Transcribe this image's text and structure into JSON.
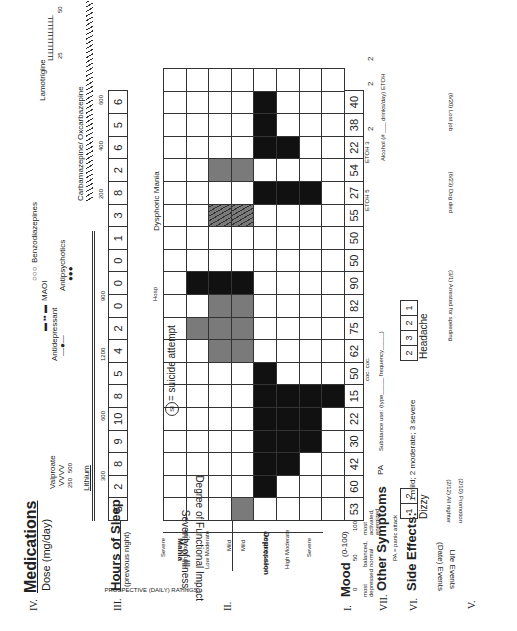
{
  "sections": {
    "medications": {
      "numeral": "IV.",
      "title": "Medications",
      "subtitle": "Dose (mg/day)"
    },
    "sleep": {
      "numeral": "III.",
      "title": "Hours of Sleep",
      "subtitle": "(previous night)"
    },
    "severity": {
      "numeral": "II.",
      "title_line1": "Severity of Illness:",
      "title_line2": "Degree of Functional Impact"
    },
    "mood": {
      "numeral": "I.",
      "title": "Mood",
      "range": "(0-100)",
      "low_value": "0",
      "mid_value": "50",
      "high_value": "100",
      "low_label": "most depressed",
      "mid_label": "balanced, normal",
      "high_label": "most activated, energized"
    },
    "other_symptoms": {
      "numeral": "VII.",
      "title": "Other Symptoms",
      "legend": "PA = panic attack"
    },
    "side_effects": {
      "numeral": "VI.",
      "title": "Side Effects:",
      "scale": "1 mild; 2 moderate; 3 severe"
    },
    "life_events": {
      "numeral": "V.",
      "title": "Life Events",
      "subtitle": "(Date) Events"
    }
  },
  "medications": {
    "valproate": {
      "name": "Valproate",
      "marker": "VVVV",
      "doses": [
        "250",
        "500"
      ]
    },
    "lithium": {
      "name": "Lithium",
      "doses": [
        "300",
        "600",
        "1200",
        "900"
      ]
    },
    "antidepressant": {
      "name": "Antidepressant",
      "marker": "—●—"
    },
    "maoi": {
      "name": "MAOI",
      "marker": "▬ ▪▪ ▬"
    },
    "benzodiazepines": {
      "name": "Benzodiazepines",
      "marker": "○○○"
    },
    "antipsychotics": {
      "name": "Antipsychotics",
      "marker": "●●●"
    },
    "carbamazepine": {
      "name": "Carbamazepine/ Oxcarbazepine",
      "doses": [
        "200",
        "400",
        "600"
      ]
    },
    "lamotrigine": {
      "name": "Lamotrigine",
      "marker": "LLLLLLLLLLLLL",
      "doses": [
        "25",
        "50"
      ]
    }
  },
  "ratings": {
    "header": "PROSPECTIVE (DAILY) RATINGS",
    "mania_label": "Mania",
    "depression_label": "Depression",
    "mania_levels": [
      "Severe",
      "High Moderate",
      "Low Moderate",
      "Mild"
    ],
    "mania_descriptions": [
      "Unable to function",
      "Much",
      "Some",
      "Not impaired"
    ],
    "depression_levels": [
      "Mild",
      "Low Moderate",
      "High Moderate",
      "Severe"
    ],
    "depression_descriptions": [
      "Not functionally impaired",
      "Some",
      "Much",
      "Unable to function"
    ],
    "difficulty_label": "Difficulty functioning"
  },
  "annotations": {
    "hosp": "Hosp",
    "dysphoric_mania": "Dysphoric Mania",
    "suicide_symbol": "SI",
    "suicide_text": "= suicide attempt",
    "pa": "PA",
    "substance_use": "Substance use: (type_____ frequency_____)",
    "coc": "coc. coc.",
    "etoh_a": "ETOH 5",
    "etoh_b": "ETOH 3",
    "alcohol": "Alcohol (# ___ drinks/day) ETOH"
  },
  "days": {
    "sleep": [
      "5",
      "2",
      "8",
      "9",
      "10",
      "8",
      "5",
      "4",
      "2",
      "0",
      "0",
      "0",
      "1",
      "3",
      "8",
      "2",
      "6",
      "5",
      "6"
    ],
    "mood": [
      "53",
      "60",
      "42",
      "30",
      "22",
      "15",
      "50",
      "62",
      "75",
      "82",
      "90",
      "50",
      "50",
      "55",
      "27",
      "54",
      "22",
      "38",
      "40"
    ],
    "alcohol": [
      "",
      "",
      "",
      "",
      "",
      "",
      "",
      "",
      "",
      "",
      "",
      "",
      "",
      "",
      "",
      "",
      "2",
      "2",
      "2"
    ]
  },
  "side_effects": {
    "dizzy": {
      "label": "Dizzy",
      "values": [
        "1",
        "2"
      ]
    },
    "headache": {
      "label": "Headache",
      "values": [
        "2",
        "3",
        "2",
        "1"
      ]
    }
  },
  "life_events": [
    {
      "date": "(2/10)",
      "event": "Promotion"
    },
    {
      "date": "(2/12)",
      "event": "All nighter"
    },
    {
      "date": "(3/1)",
      "event": "Arrested for speeding"
    },
    {
      "date": "(6/23)",
      "event": "Dog died"
    },
    {
      "date": "(6/20)",
      "event": "Lost job"
    }
  ]
}
